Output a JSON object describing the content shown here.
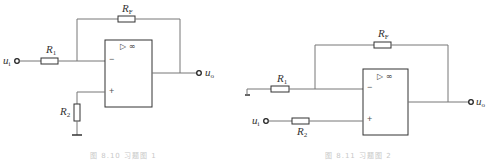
{
  "figures": [
    {
      "id": "left",
      "caption": "图 8.10  习题图 1",
      "labels": {
        "input": "u",
        "input_sub": "i",
        "output": "u",
        "output_sub": "o",
        "r1": "R",
        "r1_sub": "1",
        "r2": "R",
        "r2_sub": "2",
        "rf": "R",
        "rf_sub": "F",
        "minus": "−",
        "plus": "+",
        "opamp": "▷ ∞"
      }
    },
    {
      "id": "right",
      "caption": "图 8.11  习题图 2",
      "labels": {
        "input": "u",
        "input_sub": "i",
        "output": "u",
        "output_sub": "o",
        "r1": "R",
        "r1_sub": "1",
        "r2": "R",
        "r2_sub": "2",
        "rf": "R",
        "rf_sub": "F",
        "minus": "−",
        "plus": "+",
        "opamp": "▷ ∞"
      }
    }
  ],
  "colors": {
    "wire": "#7a7a7a",
    "component": "#333333",
    "caption": "#c8c8c8"
  }
}
